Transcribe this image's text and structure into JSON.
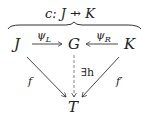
{
  "diagram": {
    "title": "c: J ⇸ K",
    "title_parts": {
      "name": "c:",
      "source": "J",
      "arrow": "⇸",
      "target": "K"
    },
    "nodes": [
      {
        "id": "J",
        "label": "J"
      },
      {
        "id": "G",
        "label": "G"
      },
      {
        "id": "K",
        "label": "K"
      },
      {
        "id": "T",
        "label": "T"
      }
    ],
    "edges": [
      {
        "from": "J",
        "to": "G",
        "label": "ψ_L",
        "display": "ψL",
        "style": "solid"
      },
      {
        "from": "K",
        "to": "G",
        "label": "ψ_R",
        "display": "ψR",
        "style": "solid"
      },
      {
        "from": "J",
        "to": "T",
        "label": "f",
        "style": "solid"
      },
      {
        "from": "K",
        "to": "T",
        "label": "f′",
        "style": "solid"
      },
      {
        "from": "G",
        "to": "T",
        "label": "∃h",
        "style": "dashed"
      }
    ],
    "labels": {
      "psi": "ψ",
      "L": "L",
      "R": "R",
      "f": "f",
      "fprime": "f′",
      "exists_h": "∃h"
    },
    "colors": {
      "ink": "#222222",
      "arrow": "#333333",
      "dashed": "#777777"
    }
  }
}
